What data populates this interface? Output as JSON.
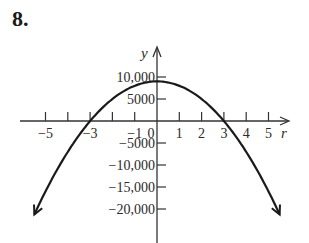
{
  "problem_number": "8.",
  "chart_data": {
    "type": "line",
    "title": "",
    "xlabel": "r",
    "ylabel": "y",
    "xlim": [
      -5.5,
      5.5
    ],
    "ylim": [
      -21250,
      11000
    ],
    "grid": false,
    "x_ticks": [
      -5,
      -4,
      -3,
      -2,
      -1,
      1,
      2,
      3,
      4,
      5
    ],
    "x_tick_labels": [
      {
        "value": -5,
        "label": "−5"
      },
      {
        "value": -3,
        "label": "−3"
      },
      {
        "value": -1,
        "label": "−1"
      },
      {
        "value": 0,
        "label": "0"
      },
      {
        "value": 1,
        "label": "1"
      },
      {
        "value": 2,
        "label": "2"
      },
      {
        "value": 3,
        "label": "3"
      },
      {
        "value": 4,
        "label": "4"
      },
      {
        "value": 5,
        "label": "5"
      }
    ],
    "y_tick_labels": [
      {
        "value": 10000,
        "label": "10,000"
      },
      {
        "value": 5000,
        "label": "5000"
      },
      {
        "value": -5000,
        "label": "−5000"
      },
      {
        "value": -10000,
        "label": "−10,000"
      },
      {
        "value": -15000,
        "label": "−15,000"
      },
      {
        "value": -20000,
        "label": "−20,000"
      }
    ],
    "series": [
      {
        "name": "y = 9000 − 1000r²",
        "description": "Downward-opening parabola, vertex (0, 9000), r-intercepts at −3 and 3, arrows at both ends",
        "x": [
          -5.5,
          -5,
          -4,
          -3,
          -2,
          -1,
          0,
          1,
          2,
          3,
          4,
          5,
          5.5
        ],
        "y": [
          -21250,
          -16000,
          -7000,
          0,
          5000,
          8000,
          9000,
          8000,
          5000,
          0,
          -7000,
          -16000,
          -21250
        ]
      }
    ]
  }
}
